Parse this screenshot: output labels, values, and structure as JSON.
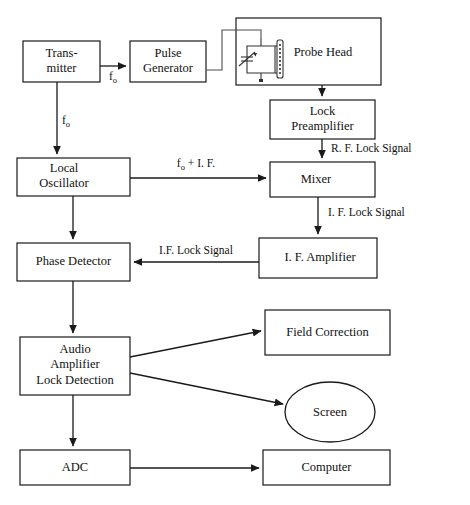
{
  "figure": {
    "top_cropped_text": "",
    "caption": "",
    "background": "#ffffff",
    "line_color": "#1a1a1a",
    "text_color": "#111111"
  },
  "blocks": {
    "transmitter": {
      "label_line1": "Trans-",
      "label_line2": "mitter",
      "x": 23,
      "y": 41,
      "w": 77,
      "h": 41
    },
    "pulse_generator": {
      "label_line1": "Pulse",
      "label_line2": "Generator",
      "x": 130,
      "y": 41,
      "w": 76,
      "h": 41
    },
    "probe_head": {
      "label": "Probe Head",
      "x": 236,
      "y": 18,
      "w": 145,
      "h": 67
    },
    "lock_preamplifier": {
      "label_line1": "Lock",
      "label_line2": "Preamplifier",
      "x": 270,
      "y": 100,
      "w": 105,
      "h": 39
    },
    "local_oscillator": {
      "label_line1": "Local",
      "label_line2": "Oscillator",
      "x": 17,
      "y": 158,
      "w": 113,
      "h": 38
    },
    "mixer": {
      "label": "Mixer",
      "x": 270,
      "y": 162,
      "w": 105,
      "h": 35
    },
    "phase_detector": {
      "label": "Phase Detector",
      "x": 17,
      "y": 243,
      "w": 113,
      "h": 38
    },
    "if_amplifier": {
      "label": "I. F. Amplifier",
      "x": 259,
      "y": 238,
      "w": 118,
      "h": 40
    },
    "audio_amplifier": {
      "label_line1": "Audio",
      "label_line2": "Amplifier",
      "label_line3": "Lock Detection",
      "x": 20,
      "y": 337,
      "w": 110,
      "h": 58
    },
    "field_correction": {
      "label": "Field Correction",
      "x": 265,
      "y": 310,
      "w": 125,
      "h": 45
    },
    "screen": {
      "label": "Screen",
      "cx": 330,
      "cy": 412,
      "rx": 45,
      "ry": 30
    },
    "adc": {
      "label": "ADC",
      "x": 20,
      "y": 450,
      "w": 110,
      "h": 35
    },
    "computer": {
      "label": "Computer",
      "x": 263,
      "y": 450,
      "w": 127,
      "h": 35
    }
  },
  "edge_labels": {
    "f0_transmitter_to_pulse": {
      "base": "f",
      "sub": "o"
    },
    "f0_transmitter_to_lo": {
      "base": "f",
      "sub": "o"
    },
    "f0_plus_if": {
      "base": "f",
      "sub": "o",
      "tail": " + I. F."
    },
    "rf_lock_signal": "R. F. Lock Signal",
    "if_lock_signal_mixer_out": "I. F. Lock Signal",
    "if_lock_signal_to_phase_detector": "I.F. Lock Signal"
  },
  "connections": [
    {
      "name": "transmitter-to-pulse-generator",
      "from": "transmitter",
      "to": "pulse_generator",
      "label": "f_o"
    },
    {
      "name": "pulse-generator-to-probe-head",
      "from": "pulse_generator",
      "to": "probe_head",
      "label": ""
    },
    {
      "name": "transmitter-to-local-oscillator",
      "from": "transmitter",
      "to": "local_oscillator",
      "label": "f_o"
    },
    {
      "name": "probe-head-to-lock-preamplifier",
      "from": "probe_head",
      "to": "lock_preamplifier",
      "label": ""
    },
    {
      "name": "lock-preamplifier-to-mixer",
      "from": "lock_preamplifier",
      "to": "mixer",
      "label": "R. F. Lock Signal"
    },
    {
      "name": "local-oscillator-to-mixer",
      "from": "local_oscillator",
      "to": "mixer",
      "label": "f_o + I. F."
    },
    {
      "name": "mixer-to-if-amplifier",
      "from": "mixer",
      "to": "if_amplifier",
      "label": "I. F. Lock Signal"
    },
    {
      "name": "if-amplifier-to-phase-detector",
      "from": "if_amplifier",
      "to": "phase_detector",
      "label": "I.F. Lock Signal"
    },
    {
      "name": "local-oscillator-to-phase-detector",
      "from": "local_oscillator",
      "to": "phase_detector",
      "label": ""
    },
    {
      "name": "phase-detector-to-audio-amplifier",
      "from": "phase_detector",
      "to": "audio_amplifier",
      "label": ""
    },
    {
      "name": "audio-amplifier-to-field-correction",
      "from": "audio_amplifier",
      "to": "field_correction",
      "label": ""
    },
    {
      "name": "audio-amplifier-to-screen",
      "from": "audio_amplifier",
      "to": "screen",
      "label": ""
    },
    {
      "name": "audio-amplifier-to-adc",
      "from": "audio_amplifier",
      "to": "adc",
      "label": ""
    },
    {
      "name": "adc-to-computer",
      "from": "adc",
      "to": "computer",
      "label": ""
    }
  ],
  "probe_circuit": {
    "name": "tank-circuit",
    "components": [
      "variable-capacitor",
      "coil",
      "ground"
    ]
  }
}
